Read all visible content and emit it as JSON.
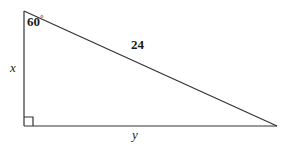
{
  "figure": {
    "type": "right-triangle-geometry-diagram",
    "background_color": "#ffffff",
    "stroke_color": "#333333",
    "labels": {
      "angle_value": "60",
      "degree_symbol": "°",
      "hypotenuse_length": "24",
      "vertical_leg": "x",
      "horizontal_leg": "y"
    },
    "vertices": {
      "apex": {
        "x": 24,
        "y": 11
      },
      "right_angle": {
        "x": 24,
        "y": 126
      },
      "base_right": {
        "x": 277,
        "y": 126
      }
    },
    "right_angle_marker": {
      "size": 8,
      "present": "true"
    }
  }
}
